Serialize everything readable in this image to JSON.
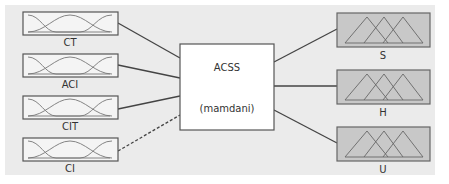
{
  "diagram": {
    "inputs": [
      {
        "label": "CT",
        "mf_type": "gaussian",
        "connection": "solid"
      },
      {
        "label": "ACI",
        "mf_type": "gaussian",
        "connection": "solid"
      },
      {
        "label": "CIT",
        "mf_type": "gaussian",
        "connection": "solid"
      },
      {
        "label": "CI",
        "mf_type": "gaussian",
        "connection": "dashed"
      }
    ],
    "system": {
      "name": "ACSS",
      "method": "(mamdani)"
    },
    "outputs": [
      {
        "label": "S",
        "mf_type": "triangular"
      },
      {
        "label": "H",
        "mf_type": "triangular"
      },
      {
        "label": "U",
        "mf_type": "triangular"
      }
    ],
    "colors": {
      "panel": "#ebebeb",
      "input_box": "#f4f4f4",
      "output_box": "#c8c8c8",
      "system_box": "#ffffff",
      "line": "#444444"
    }
  }
}
